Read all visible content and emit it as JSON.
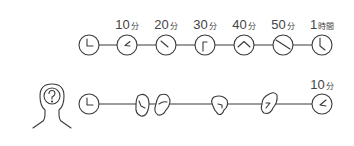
{
  "diagram": {
    "stroke_color": "#3a3a3a",
    "top_row": {
      "description": "Actual elapsed time",
      "labels": [
        {
          "num": "10",
          "unit": "分"
        },
        {
          "num": "20",
          "unit": "分"
        },
        {
          "num": "30",
          "unit": "分"
        },
        {
          "num": "40",
          "unit": "分"
        },
        {
          "num": "50",
          "unit": "分"
        },
        {
          "num": "1",
          "unit": "時間"
        }
      ],
      "clocks": [
        "0min",
        "10min",
        "20min",
        "30min",
        "40min",
        "50min",
        "60min"
      ]
    },
    "bottom_row": {
      "description": "Perceived time while distracted",
      "icon": "person-with-question-icon",
      "question_mark": "?",
      "labels": [
        {
          "num": "10",
          "unit": "分"
        }
      ],
      "items": [
        "clock-start",
        "distorted-clock",
        "distorted-clock",
        "distorted-clock",
        "distorted-clock",
        "clock-10min"
      ]
    }
  }
}
